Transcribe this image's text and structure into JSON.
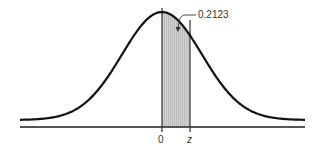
{
  "chart_data": {
    "type": "area",
    "title": "",
    "xlabel": "",
    "ylabel": "",
    "tick_labels": [
      "0",
      "z"
    ],
    "shaded_region": {
      "from": "0",
      "to": "z",
      "area": 0.2123
    },
    "annotation": "0.2123",
    "grid": false,
    "legend": null
  },
  "labels": {
    "zero": "0",
    "z": "z",
    "area": "0.2123"
  },
  "colors": {
    "curve": "#111111",
    "shade": "#c8c8c8",
    "axis": "#555555"
  }
}
